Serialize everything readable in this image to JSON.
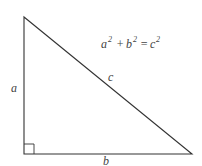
{
  "diagram": {
    "type": "right-triangle",
    "formula": {
      "a": "a",
      "b": "b",
      "c": "c",
      "exp": "2",
      "plus": "+",
      "equals": "="
    },
    "labels": {
      "side_a": "a",
      "side_b": "b",
      "side_c": "c"
    },
    "colors": {
      "stroke": "#333333",
      "text": "#444444",
      "background": "#ffffff"
    }
  }
}
